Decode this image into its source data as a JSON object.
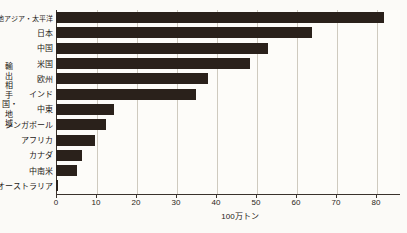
{
  "chart_data": {
    "type": "bar",
    "orientation": "horizontal",
    "title": "",
    "xlabel": "100万トン",
    "ylabel": "輸出相手国・地域",
    "xlim": [
      0,
      86
    ],
    "xticks": [
      0,
      10,
      20,
      30,
      40,
      50,
      60,
      70,
      80
    ],
    "xticklabels": [
      "0",
      "10",
      "20",
      "30",
      "40",
      "50",
      "60",
      "70",
      "80"
    ],
    "grid": true,
    "legend": false,
    "bar_color": "#2a211b",
    "categories": [
      "その他アジア・太平洋",
      "日本",
      "中国",
      "米国",
      "欧州",
      "インド",
      "中東",
      "シンガポール",
      "アフリカ",
      "カナダ",
      "中南米",
      "オーストラリア"
    ],
    "values": [
      82,
      64,
      53,
      48.5,
      38,
      35,
      14.5,
      12.5,
      9.8,
      6.5,
      5.2,
      0.6
    ]
  },
  "axis": {
    "y_title": "輸出相手国・地域",
    "x_unit": "100万トン"
  }
}
